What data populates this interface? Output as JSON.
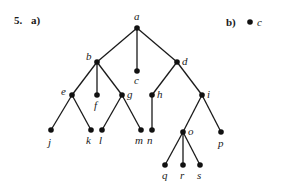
{
  "problem": {
    "number": "5.",
    "part_a": "a)",
    "part_b": "b)"
  },
  "tree_a": {
    "nodes": [
      {
        "id": "a",
        "x": 137,
        "y": 28,
        "lx": 134,
        "ly": 20
      },
      {
        "id": "b",
        "x": 97,
        "y": 62,
        "lx": 86,
        "ly": 60
      },
      {
        "id": "c",
        "x": 137,
        "y": 71,
        "lx": 134,
        "ly": 84
      },
      {
        "id": "d",
        "x": 177,
        "y": 62,
        "lx": 182,
        "ly": 65
      },
      {
        "id": "e",
        "x": 72,
        "y": 95,
        "lx": 61,
        "ly": 95
      },
      {
        "id": "f",
        "x": 97,
        "y": 95,
        "lx": 94,
        "ly": 109
      },
      {
        "id": "g",
        "x": 122,
        "y": 95,
        "lx": 127,
        "ly": 98
      },
      {
        "id": "h",
        "x": 152,
        "y": 95,
        "lx": 157,
        "ly": 98
      },
      {
        "id": "i",
        "x": 202,
        "y": 95,
        "lx": 207,
        "ly": 98
      },
      {
        "id": "j",
        "x": 51,
        "y": 130,
        "lx": 48,
        "ly": 146
      },
      {
        "id": "k",
        "x": 91,
        "y": 130,
        "lx": 86,
        "ly": 144
      },
      {
        "id": "l",
        "x": 102,
        "y": 130,
        "lx": 99,
        "ly": 144
      },
      {
        "id": "m",
        "x": 141,
        "y": 130,
        "lx": 135,
        "ly": 144
      },
      {
        "id": "n",
        "x": 152,
        "y": 130,
        "lx": 147,
        "ly": 144
      },
      {
        "id": "o",
        "x": 183,
        "y": 132,
        "lx": 188,
        "ly": 135
      },
      {
        "id": "p",
        "x": 221,
        "y": 132,
        "lx": 218,
        "ly": 147
      },
      {
        "id": "q",
        "x": 165,
        "y": 165,
        "lx": 162,
        "ly": 179
      },
      {
        "id": "r",
        "x": 183,
        "y": 165,
        "lx": 180,
        "ly": 179
      },
      {
        "id": "s",
        "x": 200,
        "y": 165,
        "lx": 197,
        "ly": 179
      }
    ],
    "edges": [
      [
        "a",
        "b"
      ],
      [
        "a",
        "c"
      ],
      [
        "a",
        "d"
      ],
      [
        "b",
        "e"
      ],
      [
        "b",
        "f"
      ],
      [
        "b",
        "g"
      ],
      [
        "d",
        "h"
      ],
      [
        "d",
        "i"
      ],
      [
        "e",
        "j"
      ],
      [
        "e",
        "k"
      ],
      [
        "g",
        "l"
      ],
      [
        "g",
        "m"
      ],
      [
        "h",
        "n"
      ],
      [
        "i",
        "o"
      ],
      [
        "i",
        "p"
      ],
      [
        "o",
        "q"
      ],
      [
        "o",
        "r"
      ],
      [
        "o",
        "s"
      ]
    ]
  },
  "tree_b": {
    "nodes": [
      {
        "id": "c",
        "x": 250,
        "y": 22,
        "lx": 257,
        "ly": 26
      }
    ]
  }
}
